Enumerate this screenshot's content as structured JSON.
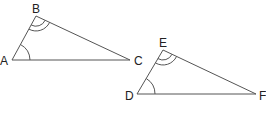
{
  "diagram": {
    "triangles": [
      {
        "name": "ABC",
        "vertices": {
          "A": {
            "label": "A",
            "x": 12,
            "y": 60
          },
          "B": {
            "label": "B",
            "x": 36,
            "y": 16
          },
          "C": {
            "label": "C",
            "x": 130,
            "y": 60
          }
        },
        "angle_marks": {
          "A": 1,
          "B": 2
        }
      },
      {
        "name": "DEF",
        "vertices": {
          "D": {
            "label": "D",
            "x": 137,
            "y": 94
          },
          "E": {
            "label": "E",
            "x": 163,
            "y": 50
          },
          "F": {
            "label": "F",
            "x": 256,
            "y": 94
          }
        },
        "angle_marks": {
          "D": 1,
          "E": 2
        }
      }
    ],
    "colors": {
      "stroke": "#555555",
      "label": "#222222"
    }
  }
}
